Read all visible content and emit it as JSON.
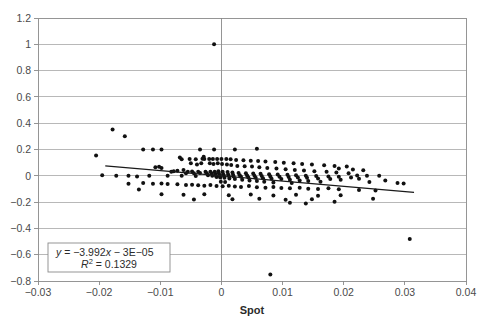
{
  "chart_data": {
    "type": "scatter",
    "title": "",
    "xlabel": "Spot",
    "ylabel": "",
    "xlim": [
      -0.03,
      0.04
    ],
    "ylim": [
      -0.8,
      1.2
    ],
    "grid": true,
    "legend_position": "none",
    "xticks": [
      "−0.03",
      "−0.02",
      "−0.01",
      "0",
      "0.01",
      "0.02",
      "0.03",
      "0.04"
    ],
    "xtick_values": [
      -0.03,
      -0.02,
      -0.01,
      0,
      0.01,
      0.02,
      0.03,
      0.04
    ],
    "yticks": [
      "1.2",
      "1",
      "0.8",
      "0.6",
      "0.4",
      "0.2",
      "0",
      "−0.2",
      "−0.4",
      "−0.6",
      "−0.8"
    ],
    "ytick_values": [
      1.2,
      1.0,
      0.8,
      0.6,
      0.4,
      0.2,
      0,
      -0.2,
      -0.4,
      -0.6,
      -0.8
    ],
    "marker_color": "#111111",
    "marker_size": 2.0,
    "trendline": {
      "slope": -3.992,
      "intercept": -3e-05,
      "x_start": -0.019,
      "x_end": 0.0315,
      "color": "#1a1a1a"
    },
    "annotation": {
      "equation_prefix": "y",
      "equation_rest": " = −3.992x − 3E−05",
      "r2_label": "R",
      "r2_sup": "2",
      "r2_rest": " = 0.1329",
      "equation_full": "y = −3.992x − 3E−05",
      "r2_full": "R² = 0.1329"
    },
    "points": [
      [
        -0.0012,
        1.0
      ],
      [
        -0.0178,
        0.352
      ],
      [
        -0.0158,
        0.3
      ],
      [
        -0.0205,
        0.155
      ],
      [
        -0.0128,
        0.2
      ],
      [
        -0.0112,
        0.2
      ],
      [
        -0.0098,
        0.2
      ],
      [
        -0.0035,
        0.2
      ],
      [
        -0.0012,
        0.2
      ],
      [
        0.0022,
        0.2
      ],
      [
        0.0058,
        0.205
      ],
      [
        -0.0195,
        0.005
      ],
      [
        -0.0172,
        0.0
      ],
      [
        -0.0152,
        0.0
      ],
      [
        -0.0138,
        -0.005
      ],
      [
        -0.0118,
        0.0
      ],
      [
        -0.0108,
        0.065
      ],
      [
        -0.0102,
        0.068
      ],
      [
        -0.0098,
        0.06
      ],
      [
        -0.0082,
        0.03
      ],
      [
        -0.0078,
        0.035
      ],
      [
        -0.0072,
        0.038
      ],
      [
        -0.0068,
        0.14
      ],
      [
        -0.0065,
        0.125
      ],
      [
        -0.0062,
        0.045
      ],
      [
        -0.0058,
        0.02
      ],
      [
        -0.0055,
        0.03
      ],
      [
        -0.0052,
        0.128
      ],
      [
        -0.005,
        0.095
      ],
      [
        -0.0048,
        0.032
      ],
      [
        -0.0045,
        0.02
      ],
      [
        -0.0042,
        0.125
      ],
      [
        -0.004,
        0.085
      ],
      [
        -0.0038,
        0.03
      ],
      [
        -0.0035,
        0.022
      ],
      [
        -0.0033,
        0.095
      ],
      [
        -0.0031,
        0.13
      ],
      [
        -0.0029,
        0.145
      ],
      [
        -0.0028,
        0.128
      ],
      [
        -0.0026,
        0.03
      ],
      [
        -0.0024,
        0.02
      ],
      [
        -0.0022,
        0.005
      ],
      [
        -0.002,
        0.128
      ],
      [
        -0.0019,
        0.095
      ],
      [
        -0.0018,
        0.03
      ],
      [
        -0.0016,
        0.018
      ],
      [
        -0.0015,
        0.0
      ],
      [
        -0.0014,
        0.128
      ],
      [
        -0.0013,
        0.09
      ],
      [
        -0.0011,
        0.03
      ],
      [
        -0.001,
        0.015
      ],
      [
        -0.0009,
        0.0
      ],
      [
        -0.0008,
        -0.01
      ],
      [
        -0.0007,
        0.128
      ],
      [
        -0.0006,
        0.095
      ],
      [
        -0.0005,
        0.035
      ],
      [
        -0.0004,
        0.018
      ],
      [
        -0.0003,
        0.0
      ],
      [
        -0.0002,
        -0.012
      ],
      [
        -0.0001,
        -0.045
      ],
      [
        0.0,
        0.128
      ],
      [
        0.0001,
        0.09
      ],
      [
        0.0002,
        0.03
      ],
      [
        0.0003,
        0.012
      ],
      [
        0.0004,
        0.0
      ],
      [
        0.0005,
        -0.015
      ],
      [
        0.0006,
        -0.048
      ],
      [
        0.0008,
        0.128
      ],
      [
        0.0009,
        0.085
      ],
      [
        0.001,
        0.028
      ],
      [
        0.0011,
        0.01
      ],
      [
        0.0012,
        -0.002
      ],
      [
        0.0013,
        -0.02
      ],
      [
        0.0015,
        0.125
      ],
      [
        0.0016,
        0.082
      ],
      [
        0.0018,
        0.025
      ],
      [
        0.0019,
        0.008
      ],
      [
        0.002,
        -0.005
      ],
      [
        0.0022,
        -0.025
      ],
      [
        0.0024,
        0.12
      ],
      [
        0.0026,
        0.075
      ],
      [
        0.0028,
        0.022
      ],
      [
        0.003,
        0.005
      ],
      [
        0.0032,
        -0.008
      ],
      [
        0.0034,
        -0.03
      ],
      [
        0.0036,
        0.118
      ],
      [
        0.0038,
        0.072
      ],
      [
        0.004,
        0.02
      ],
      [
        0.0042,
        0.002
      ],
      [
        0.0044,
        -0.012
      ],
      [
        0.0046,
        -0.035
      ],
      [
        0.0048,
        0.115
      ],
      [
        0.005,
        0.07
      ],
      [
        0.0052,
        0.018
      ],
      [
        0.0054,
        0.0
      ],
      [
        0.0056,
        -0.015
      ],
      [
        0.0058,
        -0.04
      ],
      [
        0.006,
        0.112
      ],
      [
        0.0062,
        0.065
      ],
      [
        0.0064,
        0.015
      ],
      [
        0.0066,
        -0.002
      ],
      [
        0.0068,
        -0.018
      ],
      [
        0.007,
        -0.045
      ],
      [
        0.0072,
        0.108
      ],
      [
        0.0075,
        0.06
      ],
      [
        0.0078,
        0.012
      ],
      [
        0.008,
        -0.005
      ],
      [
        0.0082,
        -0.022
      ],
      [
        0.0085,
        -0.05
      ],
      [
        0.0088,
        0.105
      ],
      [
        0.009,
        0.055
      ],
      [
        0.0092,
        0.01
      ],
      [
        0.0095,
        -0.008
      ],
      [
        0.0098,
        -0.025
      ],
      [
        0.0102,
        0.1
      ],
      [
        0.0105,
        0.05
      ],
      [
        0.0108,
        0.008
      ],
      [
        0.011,
        -0.01
      ],
      [
        0.0112,
        -0.03
      ],
      [
        0.0115,
        -0.055
      ],
      [
        0.0118,
        0.095
      ],
      [
        0.012,
        0.045
      ],
      [
        0.0122,
        0.005
      ],
      [
        0.0125,
        -0.012
      ],
      [
        0.0128,
        -0.035
      ],
      [
        0.0132,
        0.09
      ],
      [
        0.0135,
        0.04
      ],
      [
        0.0138,
        0.0
      ],
      [
        0.014,
        -0.015
      ],
      [
        0.0142,
        -0.04
      ],
      [
        0.0148,
        0.085
      ],
      [
        0.0152,
        0.035
      ],
      [
        0.0155,
        -0.002
      ],
      [
        0.0158,
        -0.02
      ],
      [
        0.0162,
        -0.045
      ],
      [
        0.0168,
        0.08
      ],
      [
        0.0172,
        0.03
      ],
      [
        0.0175,
        -0.005
      ],
      [
        0.0178,
        -0.025
      ],
      [
        0.0185,
        0.075
      ],
      [
        0.0188,
        0.025
      ],
      [
        0.0192,
        -0.008
      ],
      [
        0.0195,
        -0.03
      ],
      [
        0.0205,
        0.07
      ],
      [
        0.0208,
        0.02
      ],
      [
        0.0212,
        -0.012
      ],
      [
        0.0222,
        0.002
      ],
      [
        0.0225,
        -0.022
      ],
      [
        0.0238,
        0.0
      ],
      [
        0.0242,
        -0.048
      ],
      [
        0.0258,
        0.0
      ],
      [
        0.0268,
        -0.035
      ],
      [
        0.0288,
        -0.055
      ],
      [
        0.0298,
        -0.058
      ],
      [
        0.0308,
        -0.48
      ],
      [
        0.008,
        -0.75
      ],
      [
        -0.0152,
        -0.06
      ],
      [
        -0.0128,
        -0.055
      ],
      [
        -0.0112,
        -0.06
      ],
      [
        -0.0098,
        -0.058
      ],
      [
        -0.0088,
        -0.062
      ],
      [
        -0.0072,
        -0.065
      ],
      [
        -0.0058,
        -0.07
      ],
      [
        -0.0048,
        -0.068
      ],
      [
        -0.0038,
        -0.072
      ],
      [
        -0.0028,
        -0.075
      ],
      [
        -0.0018,
        -0.07
      ],
      [
        -0.0008,
        -0.078
      ],
      [
        0.0002,
        -0.08
      ],
      [
        0.0012,
        -0.075
      ],
      [
        0.0022,
        -0.082
      ],
      [
        0.0032,
        -0.085
      ],
      [
        0.0045,
        -0.078
      ],
      [
        0.0058,
        -0.088
      ],
      [
        0.0072,
        -0.09
      ],
      [
        0.0085,
        -0.085
      ],
      [
        0.0098,
        -0.092
      ],
      [
        0.0112,
        -0.095
      ],
      [
        0.0128,
        -0.09
      ],
      [
        0.0142,
        -0.098
      ],
      [
        0.0158,
        -0.1
      ],
      [
        0.0175,
        -0.095
      ],
      [
        0.0192,
        -0.102
      ],
      [
        -0.0098,
        -0.14
      ],
      [
        -0.0062,
        -0.145
      ],
      [
        -0.0028,
        -0.14
      ],
      [
        0.0012,
        -0.148
      ],
      [
        0.0048,
        -0.142
      ],
      [
        0.0085,
        -0.15
      ],
      [
        0.0122,
        -0.145
      ],
      [
        0.0158,
        -0.152
      ],
      [
        0.0195,
        -0.148
      ],
      [
        -0.0135,
        -0.105
      ],
      [
        0.0225,
        -0.108
      ],
      [
        0.0252,
        -0.112
      ],
      [
        0.0062,
        -0.175
      ],
      [
        0.0105,
        -0.182
      ],
      [
        0.0148,
        -0.178
      ],
      [
        -0.0045,
        -0.18
      ],
      [
        0.0018,
        -0.178
      ],
      [
        0.0248,
        -0.175
      ],
      [
        0.0112,
        -0.205
      ],
      [
        0.0185,
        -0.198
      ],
      [
        0.0138,
        -0.21
      ],
      [
        -0.0065,
        0.0
      ],
      [
        -0.0088,
        0.0
      ],
      [
        -0.0042,
        -0.002
      ],
      [
        0.0192,
        0.055
      ],
      [
        0.0215,
        0.048
      ],
      [
        0.0232,
        0.042
      ]
    ]
  },
  "geometry": {
    "plot_left": 38,
    "plot_right": 466,
    "plot_top": 18,
    "plot_bottom": 281
  }
}
